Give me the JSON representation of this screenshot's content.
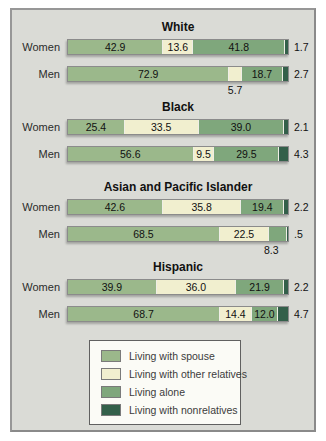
{
  "chart_data": {
    "type": "bar",
    "orientation": "horizontal",
    "stacked": true,
    "unit": "percent",
    "x_range": [
      0,
      100
    ],
    "grid": false,
    "categories": [
      "Living with spouse",
      "Living with other relatives",
      "Living alone",
      "Living with nonrelatives"
    ],
    "colors": [
      "#9bb88b",
      "#f1efcf",
      "#7fa77c",
      "#33604a"
    ],
    "groups": [
      {
        "title": "White",
        "rows": [
          {
            "label": "Women",
            "values": [
              42.9,
              13.6,
              41.8,
              1.7
            ],
            "segment_labels": [
              "42.9",
              "13.6",
              "41.8",
              ""
            ],
            "end_label": "1.7"
          },
          {
            "label": "Men",
            "values": [
              72.9,
              5.7,
              18.7,
              2.7
            ],
            "segment_labels": [
              "72.9",
              "",
              "18.7",
              ""
            ],
            "end_label": "2.7",
            "below_label": {
              "text": "5.7",
              "segment": 1
            }
          }
        ]
      },
      {
        "title": "Black",
        "rows": [
          {
            "label": "Women",
            "values": [
              25.4,
              33.5,
              39.0,
              2.1
            ],
            "segment_labels": [
              "25.4",
              "33.5",
              "39.0",
              ""
            ],
            "end_label": "2.1"
          },
          {
            "label": "Men",
            "values": [
              56.6,
              9.5,
              29.5,
              4.3
            ],
            "segment_labels": [
              "56.6",
              "9.5",
              "29.5",
              ""
            ],
            "end_label": "4.3"
          }
        ]
      },
      {
        "title": "Asian and Pacific Islander",
        "rows": [
          {
            "label": "Women",
            "values": [
              42.6,
              35.8,
              19.4,
              2.2
            ],
            "segment_labels": [
              "42.6",
              "35.8",
              "19.4",
              ""
            ],
            "end_label": "2.2"
          },
          {
            "label": "Men",
            "values": [
              68.5,
              22.5,
              8.3,
              0.5
            ],
            "segment_labels": [
              "68.5",
              "22.5",
              "",
              ""
            ],
            "end_label": ".5",
            "below_label": {
              "text": "8.3",
              "segment": 2
            }
          }
        ]
      },
      {
        "title": "Hispanic",
        "rows": [
          {
            "label": "Women",
            "values": [
              39.9,
              36.0,
              21.9,
              2.2
            ],
            "segment_labels": [
              "39.9",
              "36.0",
              "21.9",
              ""
            ],
            "end_label": "2.2"
          },
          {
            "label": "Men",
            "values": [
              68.7,
              14.4,
              12.0,
              4.7
            ],
            "segment_labels": [
              "68.7",
              "14.4",
              "12.0",
              ""
            ],
            "end_label": "4.7"
          }
        ]
      }
    ],
    "legend": {
      "position": "bottom",
      "items": [
        {
          "label": "Living with spouse",
          "color": "#9bb88b"
        },
        {
          "label": "Living with other relatives",
          "color": "#f1efcf"
        },
        {
          "label": "Living alone",
          "color": "#7fa77c"
        },
        {
          "label": "Living with nonrelatives",
          "color": "#33604a"
        }
      ]
    }
  }
}
